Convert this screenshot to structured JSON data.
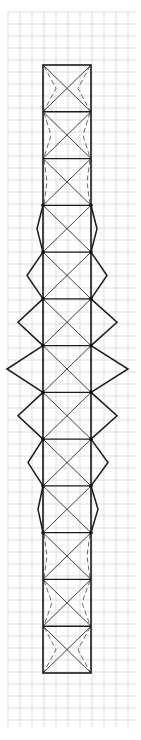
{
  "canvas": {
    "width": 141,
    "height": 740,
    "background": "#ffffff"
  },
  "grid": {
    "color": "#d4d4d4",
    "spacing": 12,
    "x_start": 8,
    "x_end": 136,
    "y_start": 12,
    "y_end": 727
  },
  "drawing": {
    "description": "Crease-pattern style sketch on grid paper: tall rectangular column of 13 square cells with X diagonals; middle cells sprout diamond wings that widen toward the center; end cells show dashed fold lines.",
    "stroke_color": "#1a1a1a",
    "frame": {
      "left": 43,
      "right": 91,
      "top": 65,
      "bottom": 673,
      "cells": 13
    },
    "wings": [
      {
        "cell": 3,
        "left_x": 37,
        "right_x": 97
      },
      {
        "cell": 4,
        "left_x": 27,
        "right_x": 107
      },
      {
        "cell": 5,
        "left_x": 18,
        "right_x": 117
      },
      {
        "cell": 6,
        "left_x": 7,
        "right_x": 128
      },
      {
        "cell": 7,
        "left_x": 18,
        "right_x": 117
      },
      {
        "cell": 8,
        "left_x": 28,
        "right_x": 108
      },
      {
        "cell": 9,
        "left_x": 38,
        "right_x": 98
      }
    ],
    "dashed_folds": [
      {
        "cell": 0,
        "left_x": 56,
        "right_x": 78
      },
      {
        "cell": 1,
        "left_x": 51,
        "right_x": 83
      },
      {
        "cell": 2,
        "left_x": 47,
        "right_x": 87
      },
      {
        "cell": 10,
        "left_x": 47,
        "right_x": 87
      },
      {
        "cell": 11,
        "left_x": 52,
        "right_x": 82
      },
      {
        "cell": 12,
        "left_x": 56,
        "right_x": 78
      }
    ],
    "nodes_on_cells": [
      3,
      4,
      5,
      6,
      7,
      8,
      9,
      10
    ]
  }
}
